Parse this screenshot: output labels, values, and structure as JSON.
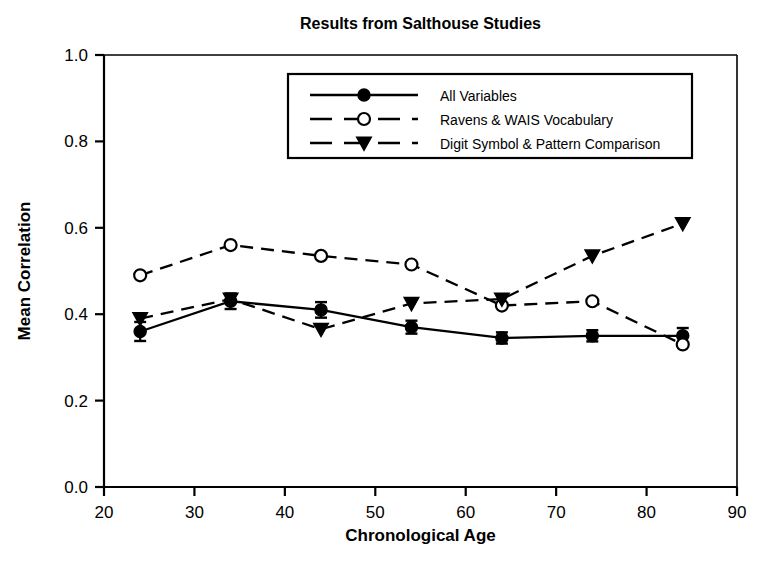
{
  "chart_data": {
    "type": "line",
    "title": "Results from Salthouse Studies",
    "xlabel": "Chronological Age",
    "ylabel": "Mean Correlation",
    "x": [
      24,
      34,
      44,
      54,
      64,
      74,
      84
    ],
    "xlim": [
      20,
      90
    ],
    "ylim": [
      0.0,
      1.0
    ],
    "xticks": [
      "20",
      "30",
      "40",
      "50",
      "60",
      "70",
      "80",
      "90"
    ],
    "xtick_values": [
      20,
      30,
      40,
      50,
      60,
      70,
      80,
      90
    ],
    "yticks": [
      "0.0",
      "0.2",
      "0.4",
      "0.6",
      "0.8",
      "1.0"
    ],
    "ytick_values": [
      0.0,
      0.2,
      0.4,
      0.6,
      0.8,
      1.0
    ],
    "grid": false,
    "legend_position": "upper center",
    "series": [
      {
        "name": "All Variables",
        "marker": "filled-circle",
        "linestyle": "solid",
        "color": "#000000",
        "values": [
          0.36,
          0.43,
          0.41,
          0.37,
          0.345,
          0.35,
          0.35
        ],
        "errors": [
          0.022,
          0.018,
          0.018,
          0.015,
          0.013,
          0.013,
          0.018
        ]
      },
      {
        "name": "Ravens & WAIS Vocabulary",
        "marker": "open-circle",
        "linestyle": "dashed",
        "color": "#000000",
        "values": [
          0.49,
          0.56,
          0.535,
          0.515,
          0.42,
          0.43,
          0.33
        ],
        "errors": [
          0,
          0,
          0,
          0,
          0,
          0,
          0
        ]
      },
      {
        "name": "Digit Symbol & Pattern Comparison",
        "marker": "filled-triangle-down",
        "linestyle": "dashed",
        "color": "#000000",
        "values": [
          0.39,
          0.435,
          0.365,
          0.425,
          0.435,
          0.535,
          0.61
        ],
        "errors": [
          0,
          0,
          0,
          0,
          0,
          0,
          0
        ]
      }
    ]
  },
  "axes": {
    "title_label": "Results from Salthouse Studies",
    "x_axis_label": "Chronological Age",
    "y_axis_label": "Mean Correlation"
  },
  "legend": {
    "entries": [
      {
        "label": "All Variables"
      },
      {
        "label": "Ravens & WAIS Vocabulary"
      },
      {
        "label": "Digit Symbol & Pattern Comparison"
      }
    ]
  },
  "colors": {
    "ink": "#000000",
    "background": "#ffffff"
  }
}
